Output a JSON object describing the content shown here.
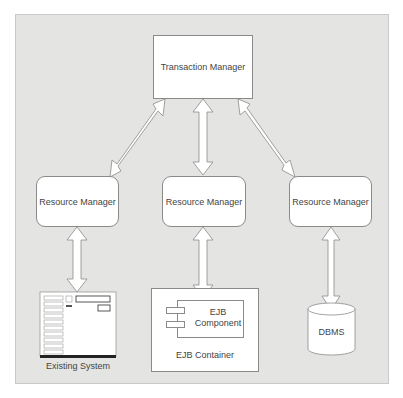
{
  "diagram": {
    "transaction_manager": {
      "label": "Transaction Manager"
    },
    "resource_managers": [
      {
        "label": "Resource Manager"
      },
      {
        "label": "Resource Manager"
      },
      {
        "label": "Resource Manager"
      }
    ],
    "existing_system": {
      "label": "Existing System"
    },
    "ejb_container": {
      "label": "EJB Container",
      "component": {
        "line1": "EJB",
        "line2": "Component"
      }
    },
    "dbms": {
      "label": "DBMS"
    },
    "edges": [
      {
        "from": "Transaction Manager",
        "to": "Resource Manager (left)",
        "type": "bidirectional"
      },
      {
        "from": "Transaction Manager",
        "to": "Resource Manager (center)",
        "type": "bidirectional"
      },
      {
        "from": "Transaction Manager",
        "to": "Resource Manager (right)",
        "type": "bidirectional"
      },
      {
        "from": "Resource Manager (left)",
        "to": "Existing System",
        "type": "bidirectional"
      },
      {
        "from": "Resource Manager (center)",
        "to": "EJB Container",
        "type": "bidirectional"
      },
      {
        "from": "Resource Manager (right)",
        "to": "DBMS",
        "type": "bidirectional"
      }
    ]
  }
}
